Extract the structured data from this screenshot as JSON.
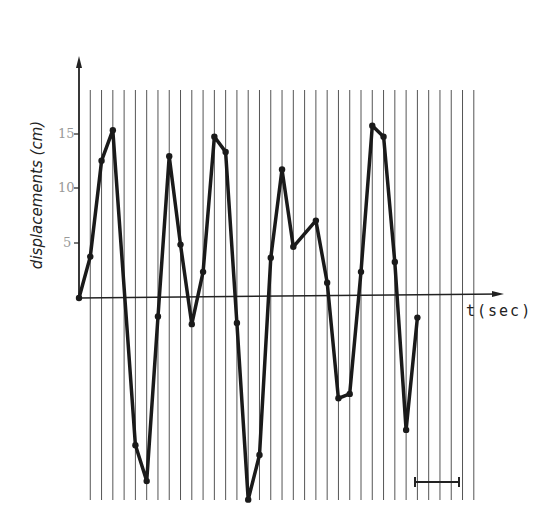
{
  "chart_data": {
    "type": "line",
    "title": "",
    "xlabel": "t(sec)",
    "ylabel": "displacements (cm)",
    "y_ticks": [
      5,
      10,
      15
    ],
    "y_tick_labels": [
      "5",
      "10",
      "15"
    ],
    "ylim": [
      -19,
      20
    ],
    "grid": {
      "vertical": true,
      "horizontal": false,
      "vertical_line_count": 35
    },
    "legend": null,
    "scale_bar": {
      "present": true,
      "span_gridlines": 4
    },
    "series": [
      {
        "name": "displacement",
        "x_index": [
          0,
          1,
          2,
          3,
          5,
          6,
          7,
          8,
          9,
          10,
          11,
          12,
          13,
          14,
          15,
          16,
          17,
          18,
          19,
          21,
          22,
          23,
          24,
          25,
          26,
          27,
          28,
          29,
          30
        ],
        "values": [
          0,
          3.8,
          12.6,
          15.4,
          -13.5,
          -16.8,
          -1.7,
          13.0,
          4.9,
          -2.4,
          2.4,
          14.8,
          13.4,
          -2.3,
          -18.5,
          -14.4,
          3.7,
          11.8,
          4.7,
          7.1,
          1.4,
          -9.2,
          -8.8,
          2.4,
          15.8,
          14.8,
          3.3,
          -12.1,
          -1.8
        ]
      }
    ]
  },
  "labels": {
    "ylabel": "displacements (cm)",
    "xlabel": "t(sec)",
    "tick_15": "15",
    "tick_10": "10",
    "tick_5": "5"
  }
}
